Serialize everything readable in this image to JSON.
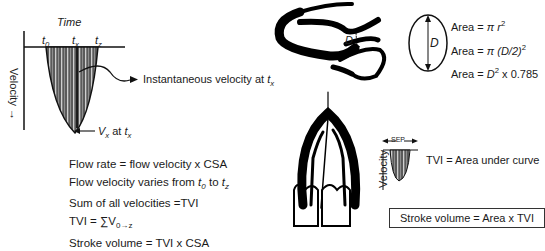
{
  "left_panel": {
    "time_label": "Time",
    "velocity_label": "Velocity",
    "velocity_arrow": "→",
    "ticks": [
      {
        "base": "t",
        "sub": "0"
      },
      {
        "base": "t",
        "sub": "x"
      },
      {
        "base": "t",
        "sub": "z"
      }
    ],
    "instantaneous_label": "Instantaneous velocity at ",
    "instantaneous_sub": "x",
    "vx_label": {
      "base": "V",
      "sub": "x",
      "mid": " at ",
      "t": "t",
      "tsub": "x"
    },
    "formulas": {
      "line1": "Flow rate = flow velocity x CSA",
      "line2_pre": "Flow velocity varies from ",
      "line2_t0": "0",
      "line2_mid": " to ",
      "line2_tz": "z",
      "line3": "Sum of all velocities =TVI",
      "line4_pre": "TVI = ∑V",
      "line4_sub": "0→z",
      "line5": "Stroke volume = TVI x CSA"
    }
  },
  "right_panel": {
    "diameter_label": "D",
    "circle_label": "D",
    "area_formulas": {
      "f1_pre": "Area = ",
      "f1_pi": "π",
      "f1_r": "r",
      "f1_sup": "2",
      "f2_pre": "Area = ",
      "f2_pi": "π",
      "f2_expr": "(D/2)",
      "f2_sup": "2",
      "f3_pre": "Area = ",
      "f3_d": "D",
      "f3_sup": "2",
      "f3_post": " x 0.785"
    },
    "small_velocity_label": "Velocity",
    "sep_label": "SEP",
    "tvi_label": "TVI = Area under curve",
    "stroke_volume_box": "Stroke volume = Area x TVI"
  },
  "colors": {
    "ink": "#111111",
    "fill_gray": "#6e6e6e",
    "stripe_light": "#d8d8d8"
  }
}
